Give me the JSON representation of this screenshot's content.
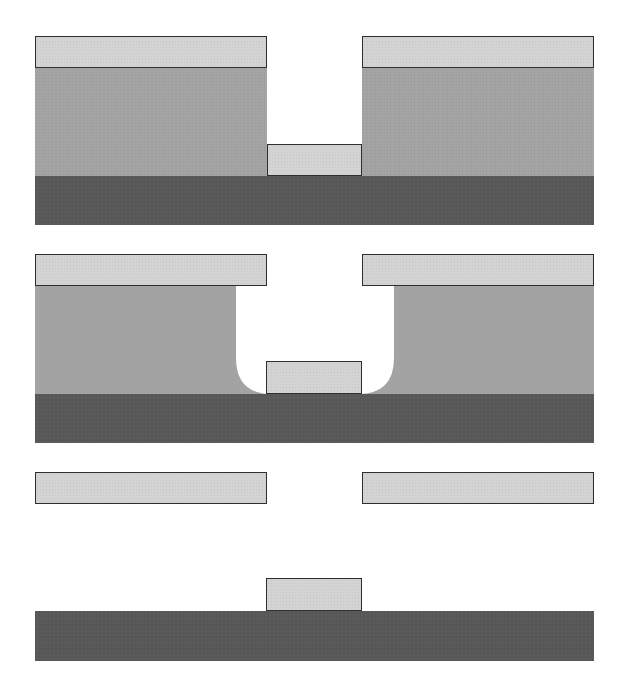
{
  "diagram": {
    "type": "process-cross-section",
    "colors": {
      "cap_layer": "#d3d3d3",
      "sacrificial_layer": "#a3a3a3",
      "substrate": "#585858",
      "outline": "#2e2e2e",
      "background": "#ffffff"
    },
    "panels": [
      {
        "id": "step-1",
        "label": "Patterned cap over sacrificial layer with opening; deposit on substrate",
        "elements": [
          {
            "kind": "cap",
            "x": 35,
            "y": 36,
            "w": 232,
            "h": 32
          },
          {
            "kind": "cap",
            "x": 362,
            "y": 36,
            "w": 232,
            "h": 32
          },
          {
            "kind": "sacrificial",
            "x": 35,
            "y": 68,
            "w": 232,
            "h": 108
          },
          {
            "kind": "sacrificial",
            "x": 362,
            "y": 68,
            "w": 232,
            "h": 108
          },
          {
            "kind": "deposit",
            "x": 267,
            "y": 144,
            "w": 95,
            "h": 32
          },
          {
            "kind": "substrate",
            "x": 35,
            "y": 176,
            "w": 559,
            "h": 49
          }
        ]
      },
      {
        "id": "step-2",
        "label": "Undercut etch of sacrificial layer with rounded cavity",
        "elements": [
          {
            "kind": "cap",
            "x": 35,
            "y": 254,
            "w": 232,
            "h": 32
          },
          {
            "kind": "cap",
            "x": 362,
            "y": 254,
            "w": 232,
            "h": 32
          },
          {
            "kind": "sacrificial-etched",
            "x": 35,
            "y": 286,
            "w": 559,
            "h": 108,
            "cavity_left": 236,
            "cavity_right": 394,
            "corner_radius": 36
          },
          {
            "kind": "deposit",
            "x": 266,
            "y": 361,
            "w": 96,
            "h": 33
          },
          {
            "kind": "substrate",
            "x": 35,
            "y": 394,
            "w": 559,
            "h": 49
          }
        ]
      },
      {
        "id": "step-3",
        "label": "Cap layer released (lifted off)",
        "elements": [
          {
            "kind": "cap",
            "x": 35,
            "y": 472,
            "w": 232,
            "h": 32
          },
          {
            "kind": "cap",
            "x": 362,
            "y": 472,
            "w": 232,
            "h": 32
          }
        ]
      },
      {
        "id": "step-4",
        "label": "Final deposit remaining on substrate",
        "elements": [
          {
            "kind": "deposit",
            "x": 266,
            "y": 578,
            "w": 96,
            "h": 33
          },
          {
            "kind": "substrate",
            "x": 35,
            "y": 611,
            "w": 559,
            "h": 50
          }
        ]
      }
    ]
  }
}
